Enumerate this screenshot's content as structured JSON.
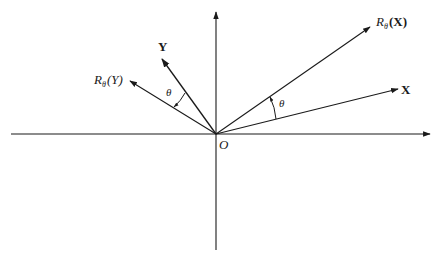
{
  "diagram": {
    "title": "",
    "origin_label": "O",
    "angle_label": "θ",
    "vectors": [
      {
        "name": "X",
        "label": "X"
      },
      {
        "name": "Y",
        "label": "Y"
      },
      {
        "name": "R_theta_X",
        "label_prefix": "R",
        "label_sub": "θ",
        "label_arg": "(X)"
      },
      {
        "name": "R_theta_Y",
        "label_prefix": "R",
        "label_sub": "θ",
        "label_arg": "(Y)"
      }
    ],
    "colors": {
      "ink": "#1a1a1a",
      "background": "#ffffff"
    }
  }
}
